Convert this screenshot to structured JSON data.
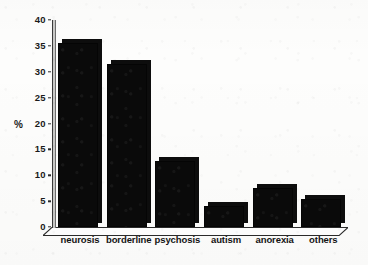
{
  "chart_data": {
    "type": "bar",
    "title": "",
    "subtitle": "",
    "xlabel": "",
    "ylabel": "%",
    "categories": [
      "neurosis",
      "borderline",
      "psychosis",
      "autism",
      "anorexia",
      "others"
    ],
    "values": [
      35.5,
      31.5,
      12.8,
      4.0,
      7.5,
      5.5
    ],
    "ylim": [
      0,
      40
    ],
    "ytick_values": [
      0,
      5,
      10,
      15,
      20,
      25,
      30,
      35,
      40
    ],
    "ytick_labels": [
      "0",
      "5",
      "10",
      "15",
      "20",
      "25",
      "30",
      "35",
      "40"
    ],
    "grid": false,
    "legend": false,
    "legend_position": "none",
    "bar_color": "#0a0a0a",
    "background_color": "#fdfdfc",
    "axis_color": "#2b2b2b",
    "style": "3d-bars-scanned"
  }
}
